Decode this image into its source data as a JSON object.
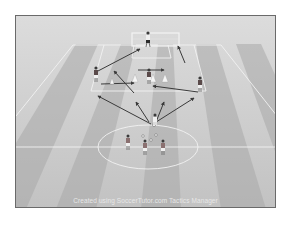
{
  "diagram": {
    "type": "soccer-tactics-drill",
    "view": "3d-perspective-pitch",
    "colors": {
      "background": "#ffffff",
      "frame_border": "#6a6a6a",
      "grass_light": "#c4c4c4",
      "grass_dark": "#a9a9a9",
      "lines": "#f2f2f2",
      "arrows": "#3a3a3a",
      "cone": "#f5f5f5",
      "player_shirt": "#5a4a4a",
      "player_shorts": "#f0f0f0",
      "goalkeeper_shirt": "#f0f0f0",
      "goalkeeper_shorts": "#2a2a2a"
    },
    "elements": {
      "goal": {
        "label": "goal"
      },
      "goalkeeper": {
        "label": "goalkeeper"
      },
      "players_top": [
        {
          "id": "left-wide"
        },
        {
          "id": "center"
        },
        {
          "id": "right-wide"
        }
      ],
      "players_bottom": [
        {
          "id": "bottom-1"
        },
        {
          "id": "bottom-2"
        },
        {
          "id": "bottom-3"
        },
        {
          "id": "bottom-4"
        }
      ],
      "cones": 4,
      "arrows": 9
    }
  },
  "caption": "Created using SoccerTutor.com Tactics Manager"
}
